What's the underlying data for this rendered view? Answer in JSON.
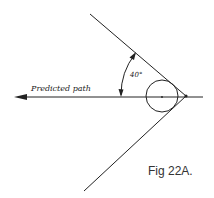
{
  "diagram": {
    "figure_label": "Fig 22A.",
    "path_label": "Predicted path",
    "angle_label": "40°",
    "angle_degrees": 40,
    "colors": {
      "line": "#222222",
      "background": "#ffffff"
    },
    "elements": [
      {
        "id": "upper-boundary-line",
        "type": "line"
      },
      {
        "id": "lower-boundary-line",
        "type": "line"
      },
      {
        "id": "predicted-path-arrow",
        "type": "arrow",
        "direction": "left"
      },
      {
        "id": "circle",
        "type": "circle"
      },
      {
        "id": "angle-arc",
        "type": "double-arrow-arc"
      }
    ]
  }
}
